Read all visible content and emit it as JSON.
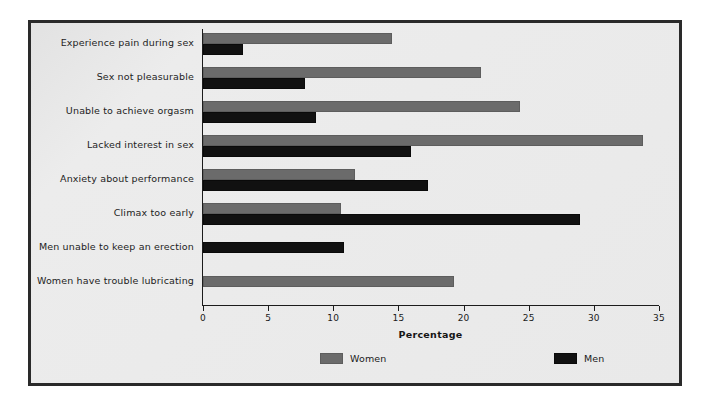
{
  "chart_data": {
    "type": "bar",
    "orientation": "horizontal",
    "title": "",
    "xlabel": "Percentage",
    "ylabel": "",
    "xlim": [
      0,
      35
    ],
    "xticks": [
      0,
      5,
      10,
      15,
      20,
      25,
      30,
      35
    ],
    "xtick_labels": [
      "0",
      "5",
      "10",
      "15",
      "20",
      "25",
      "30",
      "35"
    ],
    "grid": false,
    "legend_position": "bottom",
    "categories": [
      "Experience pain during sex",
      "Sex not pleasurable",
      "Unable to achieve orgasm",
      "Lacked interest in sex",
      "Anxiety about performance",
      "Climax too early",
      "Men unable to keep an erection",
      "Women have trouble lubricating"
    ],
    "series": [
      {
        "name": "Women",
        "color": "#6b6b6b",
        "values": [
          14.5,
          21.3,
          24.3,
          33.8,
          11.7,
          10.6,
          null,
          19.3
        ]
      },
      {
        "name": "Men",
        "color": "#111111",
        "values": [
          3.1,
          7.8,
          8.7,
          16.0,
          17.3,
          28.9,
          10.8,
          null
        ]
      }
    ]
  },
  "legend": {
    "items": [
      {
        "label": "Women",
        "swatch": "women-swatch"
      },
      {
        "label": "Men",
        "swatch": "men-swatch"
      }
    ]
  },
  "axis": {
    "x_label": "Percentage"
  },
  "colors": {
    "women": "#6b6b6b",
    "men": "#111111",
    "frame_border": "#2a2a2a",
    "plot_background": "#e8e8e8",
    "axis": "#1c1c1c"
  }
}
